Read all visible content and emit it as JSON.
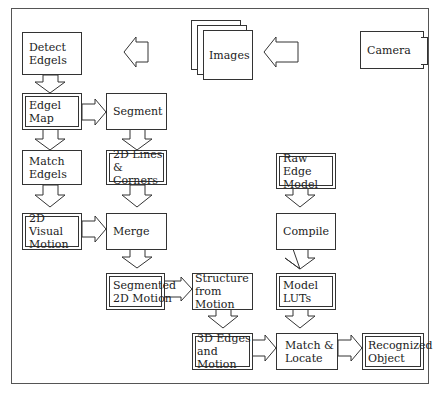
{
  "diagram": {
    "nodes": {
      "camera": "Camera",
      "images": "Images",
      "detect_edgels": "Detect\nEdgels",
      "edgel_map": "Edgel Map",
      "segment": "Segment",
      "match_edgels": "Match\nEdgels",
      "lines_corners": "2D Lines\n& Corners",
      "visual_motion": "2D Visual\nMotion",
      "merge": "Merge",
      "segmented_motion": "Segmented\n2D Motion",
      "structure_from_motion": "Structure\nfrom Motion",
      "edges_motion_3d": "3D Edges\nand Motion",
      "raw_edge_model": "Raw Edge\nModel",
      "compile": "Compile",
      "model_luts": "Model\nLUTs",
      "match_locate": "Match &\nLocate",
      "recognized_object": "Recognized\nObject"
    },
    "double_bordered": [
      "edgel_map",
      "lines_corners",
      "visual_motion",
      "segmented_motion",
      "edges_motion_3d",
      "raw_edge_model",
      "model_luts",
      "recognized_object"
    ],
    "edges": [
      [
        "camera",
        "images"
      ],
      [
        "images",
        "detect_edgels"
      ],
      [
        "detect_edgels",
        "edgel_map"
      ],
      [
        "edgel_map",
        "segment"
      ],
      [
        "edgel_map",
        "match_edgels"
      ],
      [
        "segment",
        "lines_corners"
      ],
      [
        "match_edgels",
        "visual_motion"
      ],
      [
        "lines_corners",
        "merge"
      ],
      [
        "visual_motion",
        "merge"
      ],
      [
        "merge",
        "segmented_motion"
      ],
      [
        "segmented_motion",
        "structure_from_motion"
      ],
      [
        "structure_from_motion",
        "edges_motion_3d"
      ],
      [
        "edges_motion_3d",
        "match_locate"
      ],
      [
        "raw_edge_model",
        "compile"
      ],
      [
        "compile",
        "model_luts"
      ],
      [
        "model_luts",
        "match_locate"
      ],
      [
        "match_locate",
        "recognized_object"
      ]
    ]
  }
}
